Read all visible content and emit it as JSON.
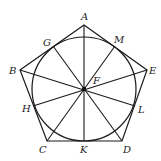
{
  "diagram": {
    "type": "geometry",
    "colors": {
      "stroke": "#1a1a1a",
      "label": "#222222",
      "background": "#ffffff"
    },
    "center": {
      "name": "F",
      "x": 84,
      "y": 89,
      "radius": 52
    },
    "vertices": [
      {
        "name": "A",
        "x": 84,
        "y": 25
      },
      {
        "name": "E",
        "x": 147,
        "y": 70
      },
      {
        "name": "D",
        "x": 122,
        "y": 141
      },
      {
        "name": "C",
        "x": 47,
        "y": 141
      },
      {
        "name": "B",
        "x": 20,
        "y": 70
      }
    ],
    "tangent_points": [
      {
        "name": "M",
        "x": 115,
        "y": 46
      },
      {
        "name": "L",
        "x": 135,
        "y": 106
      },
      {
        "name": "K",
        "x": 84,
        "y": 141
      },
      {
        "name": "H",
        "x": 33,
        "y": 106
      },
      {
        "name": "G",
        "x": 53,
        "y": 46
      }
    ],
    "spokes": [
      {
        "from": "A",
        "to": "K"
      },
      {
        "from": "B",
        "to": "L"
      },
      {
        "from": "E",
        "to": "H"
      },
      {
        "from": "C",
        "to": "M"
      },
      {
        "from": "D",
        "to": "G"
      }
    ],
    "labels": {
      "A": "A",
      "B": "B",
      "C": "C",
      "D": "D",
      "E": "E",
      "F": "F",
      "G": "G",
      "H": "H",
      "K": "K",
      "L": "L",
      "M": "M"
    }
  }
}
